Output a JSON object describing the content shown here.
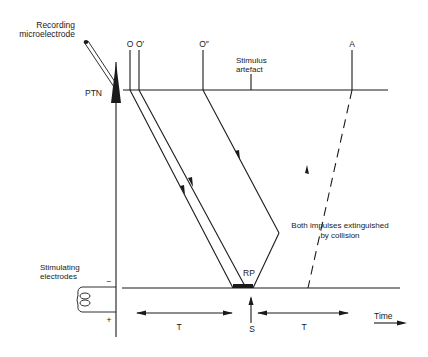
{
  "labels": {
    "recording_line1": "Recording",
    "recording_line2": "microelectrode",
    "ptn": "PTN",
    "stimulating_line1": "Stimulating",
    "stimulating_line2": "electrodes",
    "minus": "−",
    "plus": "+",
    "o": "O",
    "o_prime": "O′",
    "o_double_prime": "O″",
    "a": "A",
    "stimulus_line1": "Stimulus",
    "stimulus_line2": "artefact",
    "collision_line1": "Both impulses extinguished",
    "collision_line2": "by collision",
    "rp": "RP",
    "s": "S",
    "t_left": "T",
    "t_right": "T",
    "time": "Time"
  },
  "colors": {
    "ink": "#1a1a1a",
    "background": "#ffffff"
  }
}
